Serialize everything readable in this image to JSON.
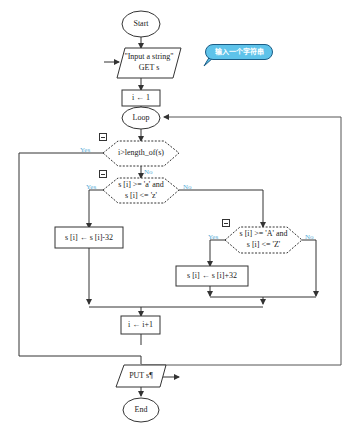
{
  "flowchart": {
    "start": "Start",
    "input_line1": "\"Input a string\"",
    "input_line2": "GET s",
    "callout": "输入一个字符串",
    "init": "i ← 1",
    "loop": "Loop",
    "cond1": "i>length_of(s)",
    "cond2_line1": "s [i] >= 'a' and",
    "cond2_line2": "s [i] <= 'z'",
    "assign_upper": "s [i] ← s [i]-32",
    "cond3_line1": "s [i] >= 'A' and",
    "cond3_line2": "s [i] <= 'Z'",
    "assign_lower": "s [i] ← s [i]+32",
    "increment": "i ← i+1",
    "output": "PUT s¶",
    "end": "End",
    "yes": "Yes",
    "no": "No"
  },
  "colors": {
    "line": "#333333",
    "yes_no_text": "#5aaed8",
    "callout_fill": "#5ec3ea",
    "callout_border": "#1b5d86"
  }
}
